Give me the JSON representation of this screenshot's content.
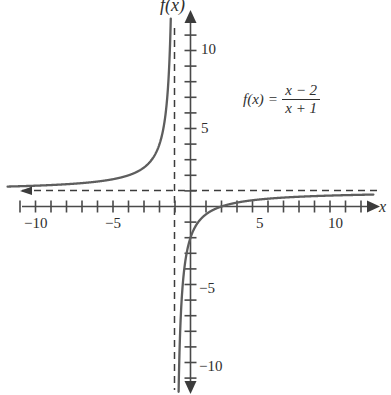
{
  "chart_data": {
    "type": "line",
    "title": "",
    "xlabel": "x",
    "ylabel": "f(x)",
    "function": "f(x) = (x - 2) / (x + 1)",
    "xlim": [
      -11.8,
      11.8
    ],
    "ylim": [
      -12.2,
      12.2
    ],
    "grid": false,
    "legend": "none",
    "x_ticks": [
      -11,
      -10,
      -9,
      -8,
      -7,
      -6,
      -5,
      -4,
      -3,
      -2,
      -1,
      1,
      2,
      3,
      4,
      5,
      6,
      7,
      8,
      9,
      10,
      11
    ],
    "y_ticks": [
      -11,
      -10,
      -9,
      -8,
      -7,
      -6,
      -5,
      -4,
      -3,
      -2,
      -1,
      1,
      2,
      3,
      4,
      5,
      6,
      7,
      8,
      9,
      10,
      11
    ],
    "x_tick_labels": [
      {
        "value": -10,
        "text": "−10"
      },
      {
        "value": -5,
        "text": "−5"
      },
      {
        "value": 5,
        "text": "5"
      },
      {
        "value": 10,
        "text": "10"
      }
    ],
    "y_tick_labels": [
      {
        "value": 10,
        "text": "10"
      },
      {
        "value": 5,
        "text": "5"
      },
      {
        "value": -5,
        "text": "−5"
      },
      {
        "value": -10,
        "text": "−10"
      }
    ],
    "asymptotes": [
      {
        "kind": "vertical",
        "value": -1,
        "style": "dashed"
      },
      {
        "kind": "horizontal",
        "value": 1,
        "style": "dashed"
      }
    ],
    "x_intercept": 2,
    "y_intercept": -2,
    "series": [
      {
        "name": "f(x) = (x - 2)/(x + 1)",
        "branch": "left",
        "color": "#5e5e5e",
        "points": [
          [
            -11.6,
            1.3
          ],
          [
            -11.0,
            1.3
          ],
          [
            -10.0,
            1.33
          ],
          [
            -9.0,
            1.38
          ],
          [
            -8.0,
            1.43
          ],
          [
            -7.0,
            1.5
          ],
          [
            -6.0,
            1.6
          ],
          [
            -5.0,
            1.75
          ],
          [
            -4.5,
            1.86
          ],
          [
            -4.0,
            2.0
          ],
          [
            -3.5,
            2.2
          ],
          [
            -3.0,
            2.5
          ],
          [
            -2.75,
            2.71
          ],
          [
            -2.5,
            3.0
          ],
          [
            -2.25,
            3.4
          ],
          [
            -2.0,
            4.0
          ],
          [
            -1.85,
            4.53
          ],
          [
            -1.7,
            5.29
          ],
          [
            -1.6,
            6.0
          ],
          [
            -1.5,
            7.0
          ],
          [
            -1.4,
            8.5
          ],
          [
            -1.33,
            10.09
          ],
          [
            -1.3,
            11.0
          ],
          [
            -1.27,
            12.11
          ]
        ]
      },
      {
        "name": "f(x) = (x - 2)/(x + 1)",
        "branch": "right",
        "color": "#5e5e5e",
        "points": [
          [
            -0.78,
            -12.64
          ],
          [
            -0.8,
            -14.0
          ],
          [
            -0.75,
            -11.0
          ],
          [
            -0.7,
            -9.0
          ],
          [
            -0.65,
            -7.57
          ],
          [
            -0.6,
            -6.5
          ],
          [
            -0.5,
            -5.0
          ],
          [
            -0.4,
            -4.0
          ],
          [
            -0.3,
            -3.29
          ],
          [
            -0.2,
            -2.75
          ],
          [
            -0.1,
            -2.33
          ],
          [
            0.0,
            -2.0
          ],
          [
            0.25,
            -1.4
          ],
          [
            0.5,
            -1.0
          ],
          [
            0.75,
            -0.71
          ],
          [
            1.0,
            -0.5
          ],
          [
            1.5,
            -0.2
          ],
          [
            2.0,
            0.0
          ],
          [
            3.0,
            0.25
          ],
          [
            4.0,
            0.4
          ],
          [
            5.0,
            0.5
          ],
          [
            6.0,
            0.571
          ],
          [
            7.0,
            0.625
          ],
          [
            8.0,
            0.667
          ],
          [
            9.0,
            0.7
          ],
          [
            10.0,
            0.727
          ],
          [
            11.0,
            0.75
          ],
          [
            11.6,
            0.762
          ]
        ]
      }
    ]
  },
  "labels": {
    "y_axis_name": "f(x)",
    "x_axis_name": "x",
    "x_tick_neg10": "−10",
    "x_tick_neg5": "−5",
    "x_tick_pos5": "5",
    "x_tick_pos10": "10",
    "y_tick_pos10": "10",
    "y_tick_pos5": "5",
    "y_tick_neg5": "−5",
    "y_tick_neg10": "−10"
  },
  "formula": {
    "lhs": "f(x)",
    "equals": "=",
    "numerator": "x − 2",
    "denominator": "x + 1"
  },
  "colors": {
    "curve": "#5e5e5e",
    "axis": "#4a4a4a",
    "text": "#2e2e2e",
    "background": "#ffffff"
  }
}
